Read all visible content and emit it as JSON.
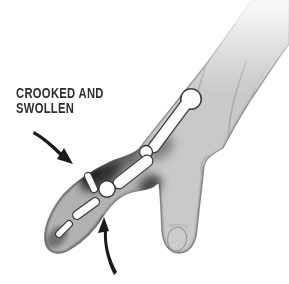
{
  "figure": {
    "annotation": {
      "label_line1": "CROOKED AND",
      "label_line2": "SWOLLEN",
      "full_label": "CROOKED AND SWOLLEN"
    },
    "arrows": [
      {
        "name": "upper-pointer-arrow",
        "direction": "down-right",
        "points_to": "swollen crooked finger joint (top side)"
      },
      {
        "name": "lower-pointer-arrow",
        "direction": "up",
        "points_to": "crooked finger joint (underside)"
      }
    ],
    "illustration_parts": {
      "hand": "back of hand with forearm entering from top right",
      "injured_finger": "index finger pointing down-left, crooked and swollen at middle joint",
      "bones_visible": [
        "metacarpal",
        "proximal phalanx",
        "dislocated joint fragment",
        "middle phalanx",
        "distal phalanx"
      ],
      "other_finger": "adjacent finger hanging downward with nail visible"
    },
    "colors": {
      "background": "#ffffff",
      "text_ink": "#2e2e2e",
      "arrow_ink": "#1a1a1a",
      "hand_fill": "#c9c9c9",
      "hand_edge": "#8c8c8c",
      "finger_shade": "#b0b0b0",
      "swelling_shade": "#262626",
      "bone_fill": "#fdfdfd",
      "bone_outline": "#3a3a3a"
    }
  }
}
